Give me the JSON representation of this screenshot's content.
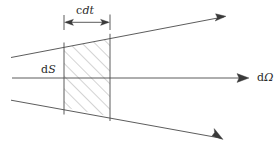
{
  "figure": {
    "background_color": "#ffffff",
    "line_color": "#4a4a4a",
    "hatch_color": "#9a9a9a",
    "text_color": "#2b2b2b",
    "width": 280,
    "height": 151,
    "labels": {
      "thickness": {
        "prefix": "c",
        "variable": "dt",
        "full": "c dt"
      },
      "area": {
        "prefix": "d",
        "variable": "S",
        "full": "dS"
      },
      "solid_angle": {
        "prefix": "d",
        "variable": "Ω",
        "full": "dΩ"
      }
    },
    "geometry": {
      "axis": {
        "x1": 12,
        "y1": 78,
        "x2": 246,
        "y2": 78,
        "arrow": "right"
      },
      "upper_ray": {
        "x1": 11,
        "y1": 57,
        "x2": 226,
        "y2": 16,
        "arrow": "end"
      },
      "lower_ray": {
        "x1": 11,
        "y1": 100,
        "x2": 223,
        "y2": 139,
        "arrow": "end"
      },
      "slab_left_x": 64,
      "slab_right_x": 110,
      "dimension_line_y": 22,
      "tick_top": 15,
      "tick_bottom": 30,
      "hatch_angle_deg": 45,
      "hatch_spacing": 9
    },
    "icon_names": {
      "axis_arrow": "arrow-right-icon",
      "upper_ray_arrow": "arrow-up-right-icon",
      "lower_ray_arrow": "arrow-down-right-icon",
      "dimension_left_arrow": "arrow-left-icon",
      "dimension_right_arrow": "arrow-right-icon"
    }
  }
}
